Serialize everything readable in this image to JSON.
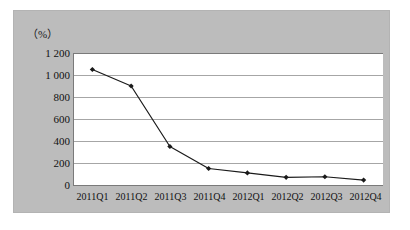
{
  "figure": {
    "unit_label": "（%）",
    "panel_color": "#bcbcbc",
    "plot_background": "#ffffff",
    "series_color": "#1a1a1a",
    "grid_color": "#a6a6a6",
    "axis_color": "#7a7a7a"
  },
  "chart_data": {
    "type": "line",
    "title": "",
    "xlabel": "",
    "ylabel": "（%）",
    "categories": [
      "2011Q1",
      "2011Q2",
      "2011Q3",
      "2011Q4",
      "2012Q1",
      "2012Q2",
      "2012Q3",
      "2012Q4"
    ],
    "values": [
      1050,
      900,
      350,
      150,
      110,
      70,
      75,
      45
    ],
    "series": [
      {
        "name": "",
        "values": [
          1050,
          900,
          350,
          150,
          110,
          70,
          75,
          45
        ]
      }
    ],
    "ylim": [
      0,
      1200
    ],
    "ytick_values": [
      0,
      200,
      400,
      600,
      800,
      1000,
      1200
    ],
    "ytick_labels": [
      "0",
      "200",
      "400",
      "600",
      "800",
      "1 000",
      "1 200"
    ],
    "grid": "horizontal",
    "legend": "none",
    "marker": "filled-diamond"
  }
}
